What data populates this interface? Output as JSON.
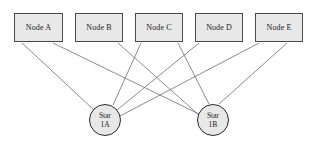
{
  "diagram": {
    "background_color": "#ffffff",
    "node_fill_color": "#e8e8e8",
    "node_border_color": "#4a4a4a",
    "edge_color": "#6e6e6e",
    "text_color": "#1a1a1a",
    "nodes": [
      {
        "id": "node-a",
        "label": "Node A",
        "x": 14,
        "y": 13,
        "width": 49,
        "height": 29
      },
      {
        "id": "node-b",
        "label": "Node B",
        "x": 75,
        "y": 13,
        "width": 48,
        "height": 29
      },
      {
        "id": "node-c",
        "label": "Node C",
        "x": 135,
        "y": 13,
        "width": 48,
        "height": 29
      },
      {
        "id": "node-d",
        "label": "Node D",
        "x": 195,
        "y": 13,
        "width": 48,
        "height": 29
      },
      {
        "id": "node-e",
        "label": "Node E",
        "x": 255,
        "y": 13,
        "width": 48,
        "height": 29
      }
    ],
    "stars": [
      {
        "id": "star-1a",
        "line1": "Star",
        "line2": "1A",
        "cx": 105,
        "cy": 120,
        "r": 16
      },
      {
        "id": "star-1b",
        "line1": "Star",
        "line2": "1B",
        "cx": 213,
        "cy": 120,
        "r": 16
      }
    ],
    "edges": [
      {
        "id": "edge-a-1a",
        "from": "node-a",
        "to": "star-1a",
        "x1": 22,
        "y1": 43,
        "x2": 94,
        "y2": 110
      },
      {
        "id": "edge-a-1b",
        "from": "node-a",
        "to": "star-1b",
        "x1": 53,
        "y1": 43,
        "x2": 199,
        "y2": 114
      },
      {
        "id": "edge-b-1b",
        "from": "node-b",
        "to": "star-1b",
        "x1": 118,
        "y1": 43,
        "x2": 200,
        "y2": 116
      },
      {
        "id": "edge-c-1a",
        "from": "node-c",
        "to": "star-1a",
        "x1": 141,
        "y1": 43,
        "x2": 113,
        "y2": 105
      },
      {
        "id": "edge-c-1b",
        "from": "node-c",
        "to": "star-1b",
        "x1": 178,
        "y1": 43,
        "x2": 209,
        "y2": 104
      },
      {
        "id": "edge-d-1a",
        "from": "node-d",
        "to": "star-1a",
        "x1": 199,
        "y1": 43,
        "x2": 117,
        "y2": 110
      },
      {
        "id": "edge-e-1a",
        "from": "node-e",
        "to": "star-1a",
        "x1": 259,
        "y1": 43,
        "x2": 120,
        "y2": 116
      },
      {
        "id": "edge-e-1b",
        "from": "node-e",
        "to": "star-1b",
        "x1": 287,
        "y1": 43,
        "x2": 219,
        "y2": 104
      }
    ]
  }
}
